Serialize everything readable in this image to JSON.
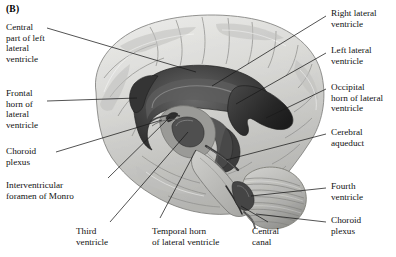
{
  "figure": {
    "panel_label": "(B)",
    "background_color": "#ffffff",
    "line_color": "#1a1a1a",
    "text_color": "#111111"
  },
  "labels": {
    "central_part_left_lateral_ventricle": "Central\npart of left\nlateral\nventricle",
    "frontal_horn_lateral_ventricle": "Frontal\nhorn of\nlateral\nventricle",
    "choroid_plexus_left": "Choroid\nplexus",
    "interventricular_foramen_of_monro": "Interventricular\nforamen of Monro",
    "third_ventricle": "Third\nventricle",
    "temporal_horn_lateral_ventricle": "Temporal horn\nof lateral ventricle",
    "central_canal": "Central\ncanal",
    "right_lateral_ventricle": "Right lateral\nventricle",
    "left_lateral_ventricle": "Left lateral\nventricle",
    "occipital_horn_lateral_ventricle": "Occipital\nhorn of lateral\nventricle",
    "cerebral_aqueduct": "Cerebral\naqueduct",
    "fourth_ventricle": "Fourth\nventricle",
    "choroid_plexus_right": "Choroid\nplexus"
  },
  "illustration": {
    "type": "anatomical-line-and-tone-drawing",
    "palette": {
      "cortex_light": "#e3e3e1",
      "cortex_mid": "#c9c9c6",
      "cortex_shadow": "#a6a6a3",
      "sulcus_line": "#8a8a87",
      "ventricle_dark": "#3a3a3a",
      "ventricle_darkest": "#242424",
      "ventricle_mid": "#5e5e5e",
      "cerebellum": "#b8b8b5",
      "brainstem": "#bcbcb9",
      "outline": "#6d6d6a"
    }
  }
}
